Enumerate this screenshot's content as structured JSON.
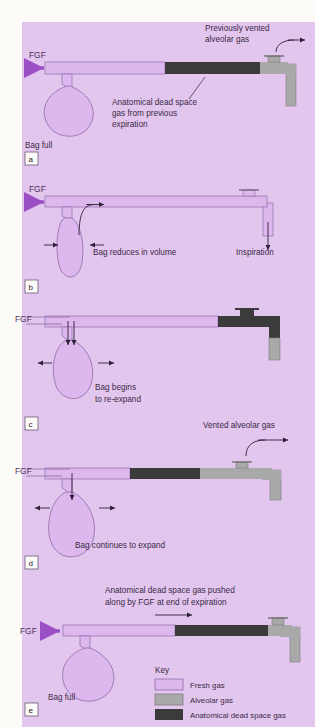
{
  "figure": {
    "background_color": "#e3c6ee",
    "page_color": "#fdfbf7",
    "colors": {
      "fresh_gas": "#ddb8ee",
      "fresh_gas_stroke": "#8e6aa6",
      "alveolar_gas": "#a9a9a9",
      "dead_space_gas": "#3b3b3b",
      "arrow_fgf": "#9b4fc4",
      "text": "#3a2a46"
    }
  },
  "panels": [
    {
      "id": "a",
      "label": "a",
      "fgf_label": "FGF",
      "annotations": [
        {
          "name": "previously-vented",
          "text_line1": "Previously vented",
          "text_line2": "alveolar gas"
        },
        {
          "name": "anatomical-dead-space",
          "text_line1": "Anatomical dead space",
          "text_line2": "gas from previous",
          "text_line3": "expiration"
        },
        {
          "name": "bag-state",
          "text_line1": "Bag full"
        }
      ]
    },
    {
      "id": "b",
      "label": "b",
      "fgf_label": "FGF",
      "annotations": [
        {
          "name": "bag-state",
          "text_line1": "Bag reduces in volume"
        },
        {
          "name": "inspiration",
          "text_line1": "Inspiration"
        }
      ]
    },
    {
      "id": "c",
      "label": "c",
      "fgf_label": "FGF",
      "annotations": [
        {
          "name": "bag-state",
          "text_line1": "Bag begins",
          "text_line2": "to re-expand"
        }
      ]
    },
    {
      "id": "d",
      "label": "d",
      "fgf_label": "FGF",
      "annotations": [
        {
          "name": "vented-alveolar",
          "text_line1": "Vented alveolar gas"
        },
        {
          "name": "bag-state",
          "text_line1": "Bag continues to expand"
        }
      ]
    },
    {
      "id": "e",
      "label": "e",
      "fgf_label": "FGF",
      "annotations": [
        {
          "name": "dead-space-pushed",
          "text_line1": "Anatomical dead space gas pushed",
          "text_line2": "along by FGF at end of expiration"
        },
        {
          "name": "bag-state",
          "text_line1": "Bag full"
        }
      ]
    }
  ],
  "key": {
    "title": "Key",
    "items": [
      {
        "label": "Fresh gas",
        "color": "#ddb8ee"
      },
      {
        "label": "Alveolar gas",
        "color": "#a9a9a9"
      },
      {
        "label": "Anatomical dead space gas",
        "color": "#3b3b3b"
      }
    ]
  }
}
